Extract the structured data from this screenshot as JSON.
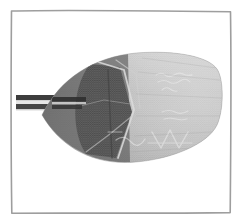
{
  "plate": {
    "background_color": "#ffffff",
    "frame": {
      "name": "hand-drawn rectangular border",
      "stroke_color": "#9e9e9e",
      "stroke_width_px": 1.6,
      "inset_px": 10,
      "style": "slightly wavy / hand-ruled"
    }
  },
  "subject": {
    "label": "elongated leaf-shaped woven artifact",
    "description": "A long tapering object resembling a feather, fan or plaited leaf blade, photographed against white paper. It tapers to a point at the left, where two dark parallel shafts form a stem or handle, and is blunt and rounded at the right end.",
    "orientation": "horizontal, tip at left, butt at right",
    "surface": "fine woven crosshatch / fabric weave texture across the whole blade",
    "tones": {
      "blade_light": "#b8b8b8",
      "blade_mid": "#9a9a9a",
      "blade_dark": "#6a6a6a",
      "blade_darkest": "#4e4e4e",
      "highlight": "#e2e2e2",
      "stem_dark": "#3f3f3f"
    },
    "parts": [
      {
        "name": "left tapered tip",
        "tone": "#5a5a5a"
      },
      {
        "name": "dark folded flap",
        "tone": "#595959"
      },
      {
        "name": "angular fold ridges",
        "tone": "#d8d8d8"
      },
      {
        "name": "light woven body",
        "tone": "#b2b2b2"
      },
      {
        "name": "rounded right butt",
        "tone": "#a8a8a8"
      },
      {
        "name": "twin stem shafts",
        "tone": "#3d3d3d"
      }
    ]
  },
  "inscriptions": [
    {
      "id": "upper",
      "text": "",
      "legible": false,
      "note": "faint two-line handwritten annotation, upper right of blade"
    },
    {
      "id": "middle",
      "text": "",
      "legible": false,
      "note": "faint short handwritten mark, middle right of blade"
    },
    {
      "id": "lower",
      "text": "",
      "legible": false,
      "note": "faint zigzag / chevron marks along lower right edge"
    }
  ]
}
